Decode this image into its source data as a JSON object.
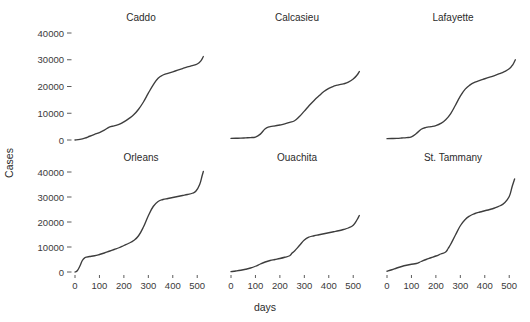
{
  "chart_data": {
    "type": "line",
    "title": "",
    "xlabel": "days",
    "ylabel": "Cases",
    "grid": false,
    "legend": "none",
    "layout": {
      "rows": 2,
      "cols": 3,
      "facet_order": [
        "Caddo",
        "Calcasieu",
        "Lafayette",
        "Orleans",
        "Ouachita",
        "St. Tammany"
      ]
    },
    "xlim": [
      0,
      540
    ],
    "ylim": [
      -1500,
      43000
    ],
    "xticks": [
      0,
      100,
      200,
      300,
      400,
      500
    ],
    "xtick_labels": [
      "0",
      "100",
      "200",
      "300",
      "400",
      "500"
    ],
    "yticks": [
      0,
      10000,
      20000,
      30000,
      40000
    ],
    "ytick_labels": [
      "0",
      "10000",
      "20000",
      "30000",
      "40000"
    ],
    "panels": [
      {
        "name": "Caddo",
        "x": [
          0,
          20,
          40,
          60,
          80,
          100,
          120,
          140,
          160,
          180,
          200,
          220,
          240,
          260,
          280,
          300,
          320,
          340,
          360,
          380,
          400,
          420,
          440,
          460,
          480,
          500,
          515,
          525
        ],
        "y": [
          0,
          250,
          700,
          1400,
          2100,
          2800,
          3700,
          4800,
          5300,
          5800,
          6800,
          8000,
          9400,
          11500,
          14200,
          17500,
          20600,
          23100,
          24300,
          24900,
          25500,
          26100,
          26700,
          27300,
          27800,
          28400,
          29600,
          31200
        ]
      },
      {
        "name": "Calcasieu",
        "x": [
          0,
          20,
          40,
          60,
          80,
          100,
          120,
          140,
          160,
          180,
          200,
          220,
          240,
          260,
          280,
          300,
          320,
          340,
          360,
          380,
          400,
          420,
          440,
          460,
          480,
          500,
          515,
          525
        ],
        "y": [
          600,
          650,
          700,
          800,
          900,
          1100,
          2200,
          4200,
          5000,
          5300,
          5600,
          6000,
          6600,
          7200,
          8800,
          10800,
          12900,
          14800,
          16500,
          18100,
          19300,
          20100,
          20600,
          21000,
          21600,
          22800,
          24200,
          25600
        ]
      },
      {
        "name": "Lafayette",
        "x": [
          0,
          20,
          40,
          60,
          80,
          100,
          120,
          140,
          160,
          180,
          200,
          220,
          240,
          260,
          280,
          300,
          320,
          340,
          360,
          380,
          400,
          420,
          440,
          460,
          480,
          500,
          515,
          525
        ],
        "y": [
          500,
          550,
          620,
          750,
          900,
          1200,
          2400,
          4000,
          4700,
          5000,
          5400,
          6200,
          7600,
          9800,
          13000,
          16400,
          19000,
          20600,
          21600,
          22300,
          22900,
          23500,
          24100,
          24800,
          25600,
          26600,
          28200,
          30000
        ]
      },
      {
        "name": "Orleans",
        "x": [
          0,
          10,
          20,
          30,
          40,
          50,
          60,
          80,
          100,
          120,
          140,
          160,
          180,
          200,
          220,
          240,
          260,
          280,
          300,
          320,
          340,
          360,
          380,
          400,
          420,
          440,
          460,
          480,
          495,
          510,
          520,
          525
        ],
        "y": [
          0,
          600,
          2400,
          4600,
          5700,
          6000,
          6200,
          6500,
          7000,
          7600,
          8300,
          9000,
          9700,
          10600,
          11500,
          12600,
          14500,
          18000,
          22500,
          26200,
          28200,
          29000,
          29400,
          29800,
          30200,
          30600,
          31000,
          31500,
          32400,
          35000,
          38500,
          40200
        ]
      },
      {
        "name": "Ouachita",
        "x": [
          0,
          20,
          40,
          60,
          80,
          100,
          120,
          140,
          160,
          180,
          200,
          220,
          240,
          250,
          260,
          280,
          300,
          320,
          340,
          360,
          380,
          400,
          420,
          440,
          460,
          480,
          500,
          515,
          525
        ],
        "y": [
          150,
          400,
          700,
          1100,
          1600,
          2300,
          3200,
          4000,
          4600,
          5000,
          5400,
          5900,
          6500,
          7600,
          8400,
          10600,
          12800,
          14000,
          14500,
          14900,
          15300,
          15700,
          16100,
          16500,
          17000,
          17600,
          18700,
          20800,
          22600
        ]
      },
      {
        "name": "St. Tammany",
        "x": [
          0,
          20,
          40,
          60,
          80,
          100,
          120,
          140,
          160,
          180,
          200,
          220,
          240,
          250,
          260,
          280,
          300,
          320,
          340,
          360,
          380,
          400,
          420,
          440,
          460,
          480,
          500,
          512,
          522
        ],
        "y": [
          300,
          900,
          1600,
          2200,
          2700,
          3100,
          3400,
          4200,
          5000,
          5700,
          6400,
          7200,
          8000,
          9400,
          11000,
          14800,
          18500,
          21000,
          22500,
          23400,
          24000,
          24500,
          25000,
          25600,
          26400,
          27600,
          30200,
          34200,
          37200
        ]
      }
    ]
  }
}
